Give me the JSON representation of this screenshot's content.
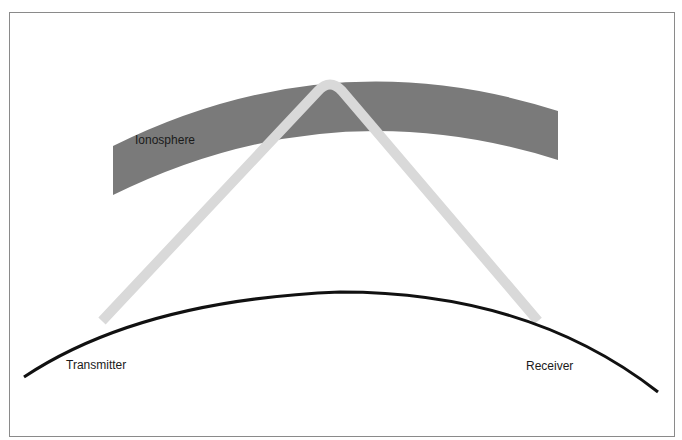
{
  "diagram": {
    "labels": {
      "ionosphere": "Ionosphere",
      "transmitter": "Transmitter",
      "receiver": "Receiver"
    },
    "colors": {
      "ionosphere_band": "#7a7a7a",
      "radio_ray": "#d9d9d9",
      "earth_surface": "#111111",
      "frame_border": "#8a8a8a",
      "background": "#ffffff",
      "text": "#1a1a1a"
    },
    "elements": [
      {
        "id": "ionosphere-band",
        "kind": "curved band",
        "description": "Ionized layer of upper atmosphere"
      },
      {
        "id": "radio-ray",
        "kind": "path",
        "description": "Radio wave from transmitter reflected off ionosphere down to receiver"
      },
      {
        "id": "earth-surface",
        "kind": "arc",
        "description": "Curved surface of the Earth"
      }
    ]
  }
}
